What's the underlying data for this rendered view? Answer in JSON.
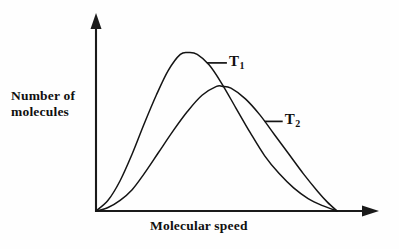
{
  "figure": {
    "background_color": "#fefefe",
    "ink_color": "#141414"
  },
  "chart_data": {
    "type": "line",
    "title": "",
    "subtitle": "",
    "xlabel": "Molecular speed",
    "ylabel": "Number of\nmolecules",
    "grid": false,
    "legend_position": "inline-annotations",
    "xlim": [
      0,
      1
    ],
    "ylim": [
      0,
      1
    ],
    "x_tick_labels": [],
    "y_tick_labels": [],
    "axis_style": "arrowed-L-axes",
    "annotations": [
      {
        "text": "T1",
        "display": "T",
        "subscript": "1",
        "curve": "T1",
        "leader": "horizontal-left"
      },
      {
        "text": "T2",
        "display": "T",
        "subscript": "2",
        "curve": "T2",
        "leader": "horizontal-left"
      }
    ],
    "series": [
      {
        "name": "T1",
        "label": "T",
        "subscript": "1",
        "description": "Lower temperature distribution: taller, narrower peak at lower speed",
        "peak_x": 0.385,
        "peak_y": 0.89,
        "x": [
          0.0,
          0.05,
          0.1,
          0.15,
          0.2,
          0.25,
          0.3,
          0.35,
          0.385,
          0.42,
          0.47,
          0.52,
          0.58,
          0.64,
          0.7,
          0.76,
          0.82,
          0.88,
          0.94,
          1.0
        ],
        "y": [
          0.0,
          0.06,
          0.17,
          0.32,
          0.49,
          0.65,
          0.79,
          0.88,
          0.89,
          0.88,
          0.82,
          0.72,
          0.58,
          0.44,
          0.31,
          0.21,
          0.13,
          0.07,
          0.03,
          0.0
        ]
      },
      {
        "name": "T2",
        "label": "T",
        "subscript": "2",
        "description": "Higher temperature distribution: shorter, broader peak at higher speed",
        "peak_x": 0.525,
        "peak_y": 0.7,
        "x": [
          0.0,
          0.05,
          0.1,
          0.15,
          0.2,
          0.26,
          0.32,
          0.38,
          0.44,
          0.5,
          0.525,
          0.56,
          0.62,
          0.68,
          0.74,
          0.8,
          0.86,
          0.92,
          0.96,
          1.0
        ],
        "y": [
          0.0,
          0.02,
          0.06,
          0.12,
          0.21,
          0.33,
          0.45,
          0.56,
          0.65,
          0.7,
          0.7,
          0.69,
          0.63,
          0.54,
          0.43,
          0.32,
          0.21,
          0.11,
          0.05,
          0.0
        ]
      }
    ]
  }
}
